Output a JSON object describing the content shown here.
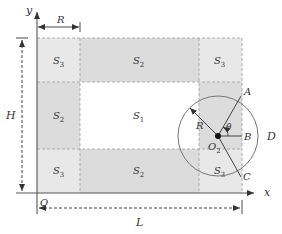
{
  "diagram": {
    "axes": {
      "x_label": "x",
      "y_label": "y",
      "origin_label": "O"
    },
    "dimensions": {
      "width_label": "L",
      "height_label": "H",
      "radius_top_label": "R"
    },
    "regions": [
      {
        "id": "top-left",
        "label": "S",
        "sub": "3"
      },
      {
        "id": "top-middle",
        "label": "S",
        "sub": "2"
      },
      {
        "id": "top-right",
        "label": "S",
        "sub": "3"
      },
      {
        "id": "middle-left",
        "label": "S",
        "sub": "2"
      },
      {
        "id": "center",
        "label": "S",
        "sub": "1"
      },
      {
        "id": "bottom-left",
        "label": "S",
        "sub": "3"
      },
      {
        "id": "bottom-middle",
        "label": "S",
        "sub": "2"
      },
      {
        "id": "bottom-right",
        "label": "S",
        "sub": "3"
      }
    ],
    "circle": {
      "center_label": "O",
      "center_sub": "2",
      "radius_label": "R",
      "angle_label": "θ",
      "point_a": "A",
      "point_b": "B",
      "point_c": "C",
      "region_label": "D"
    },
    "colors": {
      "corner_fill": "#e6e6e6",
      "edge_fill": "#d9d9d9",
      "center_fill": "#ffffff",
      "dash_line": "#9a9a9a",
      "axis": "#555555",
      "circle": "#777777"
    }
  }
}
